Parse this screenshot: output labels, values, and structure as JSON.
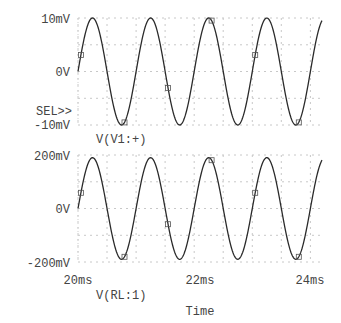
{
  "chart_data": [
    {
      "type": "line",
      "title": "",
      "xlabel": "",
      "ylabel": "",
      "selected": true,
      "sel_marker": "SEL>>",
      "y_ticks": [
        "10mV",
        "0V",
        "-10mV"
      ],
      "y_tick_values": [
        0.01,
        0,
        -0.01
      ],
      "ylim": [
        -0.0105,
        0.0105
      ],
      "xlim": [
        0.02,
        0.0242
      ],
      "grid": true,
      "series": [
        {
          "name": "V(V1:+)",
          "waveform": "sine",
          "amplitude": 0.01,
          "frequency_hz": 1000,
          "phase_deg": 0,
          "offset": 0
        }
      ],
      "legend": [
        "V(V1:+)"
      ],
      "legend_placement": "bottom-left"
    },
    {
      "type": "line",
      "title": "",
      "xlabel": "Time",
      "ylabel": "",
      "selected": false,
      "y_ticks": [
        "200mV",
        "0V",
        "-200mV"
      ],
      "y_tick_values": [
        0.2,
        0,
        -0.2
      ],
      "ylim": [
        -0.2,
        0.2
      ],
      "xlim": [
        0.02,
        0.0242
      ],
      "x_ticks": [
        "20ms",
        "22ms",
        "24ms"
      ],
      "x_tick_values": [
        0.02,
        0.022,
        0.024
      ],
      "grid": true,
      "series": [
        {
          "name": "V(RL:1)",
          "waveform": "sine",
          "amplitude": 0.19,
          "frequency_hz": 1000,
          "phase_deg": 0,
          "offset": 0
        }
      ],
      "legend": [
        "V(RL:1)"
      ],
      "legend_placement": "bottom-left"
    }
  ]
}
